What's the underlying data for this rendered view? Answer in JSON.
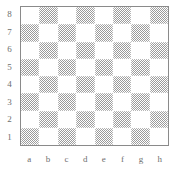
{
  "figure": {
    "kind": "chessboard-diagram",
    "board_size": 8
  },
  "labels": {
    "ranks": [
      "8",
      "7",
      "6",
      "5",
      "4",
      "3",
      "2",
      "1"
    ],
    "files": [
      "a",
      "b",
      "c",
      "d",
      "e",
      "f",
      "g",
      "h"
    ]
  },
  "colors": {
    "light_square": "#ffffff",
    "dark_square": "#9a9a9a",
    "border": "#8a8a8a",
    "label_text": "#6e6e6e",
    "background": "#ffffff"
  },
  "board": {
    "squares_light_to_move": "a1 is dark, h1 is light",
    "rows": [
      {
        "rank": "8",
        "cells": [
          {
            "square": "a8",
            "shade": "light",
            "piece": ""
          },
          {
            "square": "b8",
            "shade": "dark",
            "piece": ""
          },
          {
            "square": "c8",
            "shade": "light",
            "piece": ""
          },
          {
            "square": "d8",
            "shade": "dark",
            "piece": ""
          },
          {
            "square": "e8",
            "shade": "light",
            "piece": ""
          },
          {
            "square": "f8",
            "shade": "dark",
            "piece": ""
          },
          {
            "square": "g8",
            "shade": "light",
            "piece": ""
          },
          {
            "square": "h8",
            "shade": "dark",
            "piece": ""
          }
        ]
      },
      {
        "rank": "7",
        "cells": [
          {
            "square": "a7",
            "shade": "dark",
            "piece": ""
          },
          {
            "square": "b7",
            "shade": "light",
            "piece": ""
          },
          {
            "square": "c7",
            "shade": "dark",
            "piece": ""
          },
          {
            "square": "d7",
            "shade": "light",
            "piece": ""
          },
          {
            "square": "e7",
            "shade": "dark",
            "piece": ""
          },
          {
            "square": "f7",
            "shade": "light",
            "piece": ""
          },
          {
            "square": "g7",
            "shade": "dark",
            "piece": ""
          },
          {
            "square": "h7",
            "shade": "light",
            "piece": ""
          }
        ]
      },
      {
        "rank": "6",
        "cells": [
          {
            "square": "a6",
            "shade": "light",
            "piece": ""
          },
          {
            "square": "b6",
            "shade": "dark",
            "piece": ""
          },
          {
            "square": "c6",
            "shade": "light",
            "piece": ""
          },
          {
            "square": "d6",
            "shade": "dark",
            "piece": ""
          },
          {
            "square": "e6",
            "shade": "light",
            "piece": ""
          },
          {
            "square": "f6",
            "shade": "dark",
            "piece": ""
          },
          {
            "square": "g6",
            "shade": "light",
            "piece": ""
          },
          {
            "square": "h6",
            "shade": "dark",
            "piece": ""
          }
        ]
      },
      {
        "rank": "5",
        "cells": [
          {
            "square": "a5",
            "shade": "dark",
            "piece": ""
          },
          {
            "square": "b5",
            "shade": "light",
            "piece": ""
          },
          {
            "square": "c5",
            "shade": "dark",
            "piece": ""
          },
          {
            "square": "d5",
            "shade": "light",
            "piece": ""
          },
          {
            "square": "e5",
            "shade": "dark",
            "piece": ""
          },
          {
            "square": "f5",
            "shade": "light",
            "piece": ""
          },
          {
            "square": "g5",
            "shade": "dark",
            "piece": ""
          },
          {
            "square": "h5",
            "shade": "light",
            "piece": ""
          }
        ]
      },
      {
        "rank": "4",
        "cells": [
          {
            "square": "a4",
            "shade": "light",
            "piece": ""
          },
          {
            "square": "b4",
            "shade": "dark",
            "piece": ""
          },
          {
            "square": "c4",
            "shade": "light",
            "piece": ""
          },
          {
            "square": "d4",
            "shade": "dark",
            "piece": ""
          },
          {
            "square": "e4",
            "shade": "light",
            "piece": ""
          },
          {
            "square": "f4",
            "shade": "dark",
            "piece": ""
          },
          {
            "square": "g4",
            "shade": "light",
            "piece": ""
          },
          {
            "square": "h4",
            "shade": "dark",
            "piece": ""
          }
        ]
      },
      {
        "rank": "3",
        "cells": [
          {
            "square": "a3",
            "shade": "dark",
            "piece": ""
          },
          {
            "square": "b3",
            "shade": "light",
            "piece": ""
          },
          {
            "square": "c3",
            "shade": "dark",
            "piece": ""
          },
          {
            "square": "d3",
            "shade": "light",
            "piece": ""
          },
          {
            "square": "e3",
            "shade": "dark",
            "piece": ""
          },
          {
            "square": "f3",
            "shade": "light",
            "piece": ""
          },
          {
            "square": "g3",
            "shade": "dark",
            "piece": ""
          },
          {
            "square": "h3",
            "shade": "light",
            "piece": ""
          }
        ]
      },
      {
        "rank": "2",
        "cells": [
          {
            "square": "a2",
            "shade": "light",
            "piece": ""
          },
          {
            "square": "b2",
            "shade": "dark",
            "piece": ""
          },
          {
            "square": "c2",
            "shade": "light",
            "piece": ""
          },
          {
            "square": "d2",
            "shade": "dark",
            "piece": ""
          },
          {
            "square": "e2",
            "shade": "light",
            "piece": ""
          },
          {
            "square": "f2",
            "shade": "dark",
            "piece": ""
          },
          {
            "square": "g2",
            "shade": "light",
            "piece": ""
          },
          {
            "square": "h2",
            "shade": "dark",
            "piece": ""
          }
        ]
      },
      {
        "rank": "1",
        "cells": [
          {
            "square": "a1",
            "shade": "dark",
            "piece": ""
          },
          {
            "square": "b1",
            "shade": "light",
            "piece": ""
          },
          {
            "square": "c1",
            "shade": "dark",
            "piece": ""
          },
          {
            "square": "d1",
            "shade": "light",
            "piece": ""
          },
          {
            "square": "e1",
            "shade": "dark",
            "piece": ""
          },
          {
            "square": "f1",
            "shade": "light",
            "piece": ""
          },
          {
            "square": "g1",
            "shade": "dark",
            "piece": ""
          },
          {
            "square": "h1",
            "shade": "light",
            "piece": ""
          }
        ]
      }
    ]
  }
}
